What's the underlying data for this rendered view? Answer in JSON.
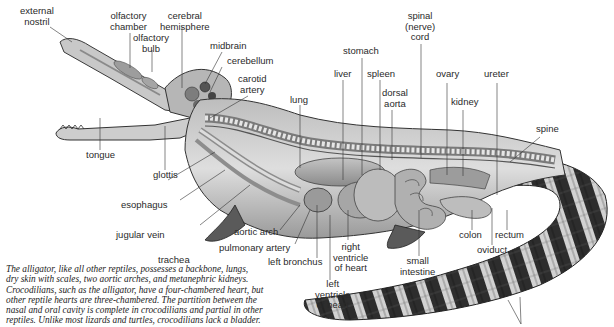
{
  "figure": {
    "labels": {
      "external_nostril": "external\nnostril",
      "olfactory_chamber": "olfactory\nchamber",
      "olfactory_bulb": "olfactory\nbulb",
      "cerebral_hemisphere": "cerebral\nhemisphere",
      "midbrain": "midbrain",
      "cerebellum": "cerebellum",
      "carotid_artery": "carotid\nartery",
      "lung": "lung",
      "liver": "liver",
      "stomach": "stomach",
      "spleen": "spleen",
      "dorsal_aorta": "dorsal\naorta",
      "spinal_cord": "spinal\n(nerve)\ncord",
      "ovary": "ovary",
      "kidney": "kidney",
      "ureter": "ureter",
      "spine": "spine",
      "tongue": "tongue",
      "glottis": "glottis",
      "esophagus": "esophagus",
      "jugular_vein": "jugular vein",
      "trachea": "trachea",
      "aortic_arch": "aortic arch",
      "pulmonary_artery": "pulmonary artery",
      "left_bronchus": "left bronchus",
      "right_ventricle": "right\nventricle\nof heart",
      "left_ventricle": "left\nventricle\nof heart",
      "small_intestine": "small\nintestine",
      "colon": "colon",
      "oviduct": "oviduct",
      "rectum": "rectum"
    },
    "caption_lines": [
      "The alligator, like all other reptiles, possesses a backbone, lungs,",
      "dry skin with scales, two aortic arches, and metanephric kidneys.",
      "Crocodilians, such as the alligator, have a four-chambered heart, but",
      "other reptile hearts are three-chambered. The partition between the",
      "nasal and oral cavity is complete in crocodilians and partial in other",
      "reptiles. Unlike most lizards and turtles, crocodilians lack a bladder."
    ],
    "colors": {
      "body_light": "#d8d8d8",
      "body_mid": "#a9a9a9",
      "body_dark": "#3a3a3a",
      "leader": "#333333"
    }
  }
}
